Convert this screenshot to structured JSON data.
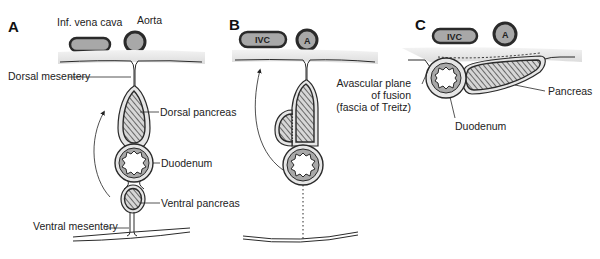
{
  "diagram": {
    "colors": {
      "outline": "#2a2a2a",
      "vessel_fill": "#a8a8a8",
      "wall_shade": "#e3e3e3",
      "organ_fill": "#d8d8d8",
      "hatch": "#555555",
      "background": "#ffffff"
    },
    "panels": [
      {
        "id": "A",
        "label": "A",
        "labels": {
          "ivc": "Inf. vena cava",
          "aorta": "Aorta",
          "dorsal_mesentery": "Dorsal mesentery",
          "dorsal_pancreas": "Dorsal pancreas",
          "duodenum": "Duodenum",
          "ventral_pancreas": "Ventral pancreas",
          "ventral_mesentery": "Ventral mesentery"
        }
      },
      {
        "id": "B",
        "label": "B",
        "labels": {
          "ivc": "IVC",
          "aorta": "A"
        }
      },
      {
        "id": "C",
        "label": "C",
        "labels": {
          "ivc": "IVC",
          "aorta": "A",
          "fusion_line1": "Avascular plane",
          "fusion_line2": "of fusion",
          "fusion_line3": "(fascia of Treitz)",
          "pancreas": "Pancreas",
          "duodenum": "Duodenum"
        }
      }
    ]
  }
}
